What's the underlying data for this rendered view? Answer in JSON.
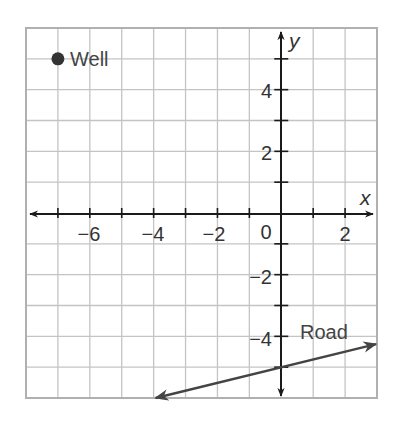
{
  "chart_data": {
    "type": "line",
    "title": "",
    "xlabel": "x",
    "ylabel": "y",
    "xlim": [
      -8,
      3
    ],
    "ylim": [
      -6,
      6
    ],
    "grid": true,
    "grid_step": 1,
    "x_ticks": [
      -6,
      -4,
      -2,
      2
    ],
    "x_tick_labels": [
      "−6",
      "−4",
      "−2",
      "2"
    ],
    "y_ticks": [
      -4,
      -2,
      2,
      4
    ],
    "y_tick_labels": [
      "−4",
      "−2",
      "2",
      "4"
    ],
    "origin_label": "0",
    "points": [
      {
        "name": "Well",
        "x": -7,
        "y": 5
      }
    ],
    "series": [
      {
        "name": "Road",
        "type": "line",
        "equation": "y = 0.25x - 5",
        "x": [
          -4,
          3
        ],
        "y": [
          -6,
          -4.25
        ],
        "arrows": "both"
      }
    ],
    "annotations": [
      {
        "text": "Well",
        "x": -6.5,
        "y": 5
      },
      {
        "text": "Road",
        "x": 0.4,
        "y": -4
      }
    ]
  },
  "labels": {
    "x_axis": "x",
    "y_axis": "y",
    "origin": "0",
    "well": "Well",
    "road": "Road",
    "x_tick_neg6": "−6",
    "x_tick_neg4": "−4",
    "x_tick_neg2": "−2",
    "x_tick_2": "2",
    "y_tick_4": "4",
    "y_tick_2": "2",
    "y_tick_neg2": "−2",
    "y_tick_neg4": "−4"
  },
  "colors": {
    "grid": "#c4c4c4",
    "axis": "#1a1a1a",
    "road": "#444444",
    "well": "#333333"
  }
}
